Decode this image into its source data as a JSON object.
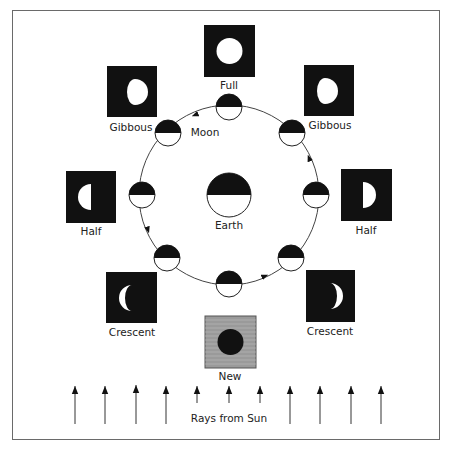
{
  "diagram": {
    "center_label": "Earth",
    "orbit_label": "Moon",
    "rays_label": "Rays from Sun",
    "phases": [
      {
        "name": "Full",
        "position": "top"
      },
      {
        "name": "Gibbous",
        "position": "top-left"
      },
      {
        "name": "Gibbous",
        "position": "top-right"
      },
      {
        "name": "Half",
        "position": "left"
      },
      {
        "name": "Half",
        "position": "right"
      },
      {
        "name": "Crescent",
        "position": "bottom-left"
      },
      {
        "name": "Crescent",
        "position": "bottom-right"
      },
      {
        "name": "New",
        "position": "bottom"
      }
    ],
    "ray_count": 11,
    "orbit_direction": "counterclockwise",
    "colors": {
      "dark": "#111111",
      "light": "#ffffff",
      "new_box_bg": "#9a9a9a",
      "line": "#444444"
    }
  }
}
